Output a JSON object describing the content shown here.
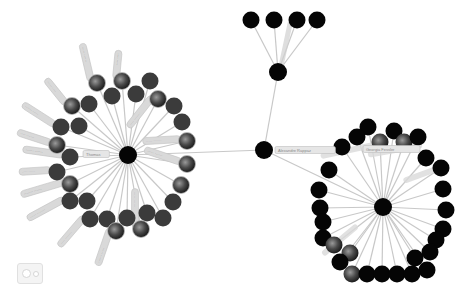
{
  "graph": {
    "colors": {
      "background": "#ffffff",
      "edge": "#c8c8c8",
      "node_black": "#050505",
      "node_gray": "#3b3b3b",
      "node_photo": "#5a5a5a",
      "label_fill": "#d9d9d9"
    },
    "hubs": [
      {
        "id": "left-hub",
        "x": 128,
        "y": 155,
        "r": 9,
        "label": "Thomas"
      },
      {
        "id": "connector",
        "x": 264,
        "y": 150,
        "r": 9,
        "label": "Alexandre Rappaz"
      },
      {
        "id": "upper",
        "x": 278,
        "y": 72,
        "r": 9,
        "label": ""
      },
      {
        "id": "right-hub",
        "x": 383,
        "y": 207,
        "r": 9,
        "label": "Georgia Fessler"
      }
    ],
    "hub_edges": [
      [
        "left-hub",
        "connector"
      ],
      [
        "connector",
        "upper"
      ],
      [
        "connector",
        "right-hub"
      ]
    ],
    "top_nodes": [
      {
        "x": 251,
        "y": 20
      },
      {
        "x": 274,
        "y": 20
      },
      {
        "x": 297,
        "y": 20
      },
      {
        "x": 317,
        "y": 20
      }
    ],
    "left_nodes": [
      {
        "x": 122,
        "y": 81,
        "kind": "photo",
        "label": "···· ····"
      },
      {
        "x": 150,
        "y": 81,
        "kind": "gray"
      },
      {
        "x": 97,
        "y": 83,
        "kind": "photo",
        "label": "····· ······"
      },
      {
        "x": 136,
        "y": 94,
        "kind": "gray"
      },
      {
        "x": 112,
        "y": 96,
        "kind": "gray"
      },
      {
        "x": 158,
        "y": 99,
        "kind": "photo",
        "label": "···· ·······"
      },
      {
        "x": 174,
        "y": 106,
        "kind": "gray"
      },
      {
        "x": 89,
        "y": 104,
        "kind": "gray"
      },
      {
        "x": 72,
        "y": 106,
        "kind": "photo",
        "label": "····· ····"
      },
      {
        "x": 182,
        "y": 122,
        "kind": "gray"
      },
      {
        "x": 79,
        "y": 126,
        "kind": "gray"
      },
      {
        "x": 61,
        "y": 127,
        "kind": "gray",
        "label": "······ ·····"
      },
      {
        "x": 187,
        "y": 141,
        "kind": "photo",
        "label": "····· ······"
      },
      {
        "x": 57,
        "y": 145,
        "kind": "photo",
        "label": "···· ······"
      },
      {
        "x": 70,
        "y": 157,
        "kind": "gray",
        "label": "······ ······"
      },
      {
        "x": 187,
        "y": 164,
        "kind": "photo",
        "label": "····· ······"
      },
      {
        "x": 57,
        "y": 172,
        "kind": "gray",
        "label": "···· ·····"
      },
      {
        "x": 181,
        "y": 185,
        "kind": "photo"
      },
      {
        "x": 70,
        "y": 184,
        "kind": "photo",
        "label": "······· ······"
      },
      {
        "x": 173,
        "y": 202,
        "kind": "gray"
      },
      {
        "x": 70,
        "y": 201,
        "kind": "gray",
        "label": "····· ·······"
      },
      {
        "x": 87,
        "y": 201,
        "kind": "gray"
      },
      {
        "x": 163,
        "y": 218,
        "kind": "gray"
      },
      {
        "x": 147,
        "y": 213,
        "kind": "gray"
      },
      {
        "x": 90,
        "y": 219,
        "kind": "gray",
        "label": "···· ·······"
      },
      {
        "x": 107,
        "y": 219,
        "kind": "gray"
      },
      {
        "x": 127,
        "y": 218,
        "kind": "gray"
      },
      {
        "x": 116,
        "y": 231,
        "kind": "photo",
        "label": "······ ·····"
      },
      {
        "x": 141,
        "y": 229,
        "kind": "photo",
        "label": "····· ······"
      }
    ],
    "right_nodes": [
      {
        "x": 368,
        "y": 127
      },
      {
        "x": 394,
        "y": 131
      },
      {
        "x": 342,
        "y": 147
      },
      {
        "x": 357,
        "y": 137
      },
      {
        "x": 380,
        "y": 142,
        "kind": "photo"
      },
      {
        "x": 404,
        "y": 142,
        "kind": "photo"
      },
      {
        "x": 418,
        "y": 137
      },
      {
        "x": 426,
        "y": 158
      },
      {
        "x": 329,
        "y": 170
      },
      {
        "x": 441,
        "y": 168
      },
      {
        "x": 319,
        "y": 190
      },
      {
        "x": 443,
        "y": 189
      },
      {
        "x": 320,
        "y": 208
      },
      {
        "x": 446,
        "y": 210
      },
      {
        "x": 323,
        "y": 222
      },
      {
        "x": 323,
        "y": 238
      },
      {
        "x": 443,
        "y": 229
      },
      {
        "x": 334,
        "y": 245,
        "kind": "photo"
      },
      {
        "x": 436,
        "y": 240
      },
      {
        "x": 350,
        "y": 253,
        "kind": "photo"
      },
      {
        "x": 415,
        "y": 258
      },
      {
        "x": 340,
        "y": 262
      },
      {
        "x": 427,
        "y": 270
      },
      {
        "x": 352,
        "y": 274,
        "kind": "photo"
      },
      {
        "x": 367,
        "y": 274
      },
      {
        "x": 382,
        "y": 274
      },
      {
        "x": 397,
        "y": 274
      },
      {
        "x": 412,
        "y": 274
      },
      {
        "x": 430,
        "y": 252
      }
    ],
    "node_radius": 8.5
  },
  "controls": {
    "toggle_button_icon": "toggle-view-icon"
  }
}
